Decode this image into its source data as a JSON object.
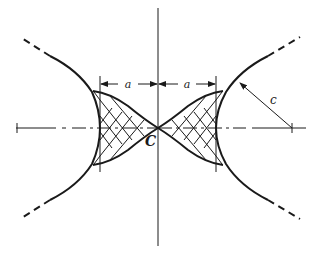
{
  "figure": {
    "type": "geometric-construction",
    "colors": {
      "stroke": "#1a1a1a",
      "background": "#ffffff"
    }
  },
  "labels": {
    "center": "C",
    "dim_left": "a",
    "dim_right": "a",
    "radius": "c"
  },
  "axes": {
    "horizontal": "dash-dot centerline",
    "vertical": "solid centerline"
  }
}
